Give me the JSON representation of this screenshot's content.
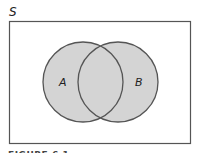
{
  "diagram": {
    "type": "venn",
    "universe_label": "S",
    "sets": [
      {
        "label": "A",
        "cx": 83,
        "cy": 82,
        "r": 40
      },
      {
        "label": "B",
        "cx": 118,
        "cy": 82,
        "r": 40
      }
    ],
    "rect": {
      "x": 9,
      "y": 21,
      "width": 182,
      "height": 123
    },
    "colors": {
      "fill": "#d4d4d4",
      "stroke": "#555555",
      "border": "#555555",
      "background": "#ffffff",
      "text": "#222222"
    }
  },
  "caption": "FIGURE 6.1"
}
